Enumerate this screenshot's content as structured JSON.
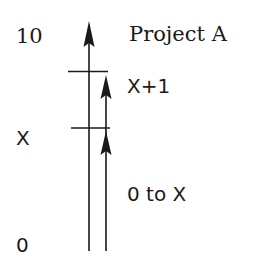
{
  "diagram": {
    "axis_labels": {
      "top": "10",
      "middle": "X",
      "bottom": "0"
    },
    "annotations": {
      "title": "Project A",
      "upper_segment": "X+1",
      "lower_segment": "0 to X"
    },
    "colors": {
      "line": "#1a1a1a",
      "background": "#ffffff"
    }
  }
}
